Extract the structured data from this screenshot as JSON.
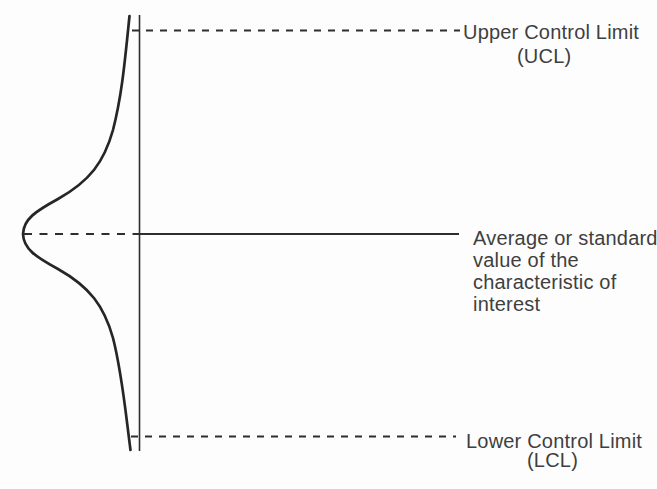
{
  "theme": {
    "line-color": "#2e2e2e",
    "curve-color": "#262626",
    "text-color": "#3f3f3f",
    "bg-color": "#fdfdfd"
  },
  "diagram": {
    "type": "control-chart-concept",
    "ucl": {
      "label": "Upper Control Limit",
      "abbr": "(UCL)"
    },
    "center_line": {
      "description_lines": [
        "Average or standard",
        "value of the",
        "characteristic of",
        "interest"
      ]
    },
    "lcl": {
      "label": "Lower Control Limit",
      "abbr": "(LCL)"
    }
  }
}
